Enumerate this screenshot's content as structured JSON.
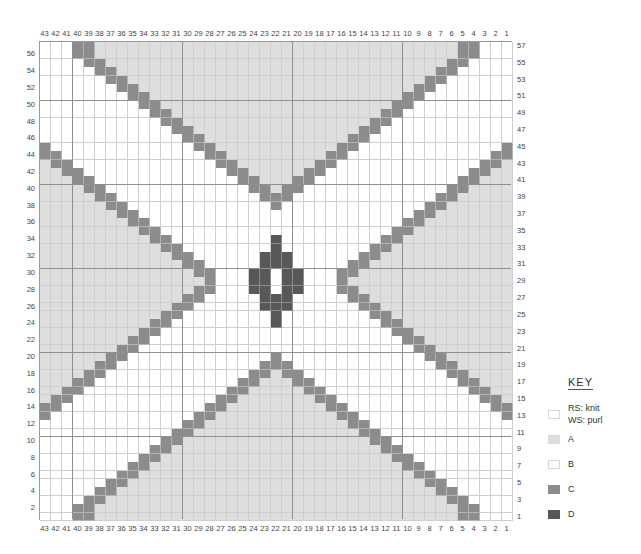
{
  "key": {
    "title": "KEY",
    "items": [
      {
        "id": "knit",
        "label_line1": "RS: knit",
        "label_line2": "WS: purl",
        "color": "#ffffff"
      },
      {
        "id": "A",
        "label": "A",
        "color": "#dedede"
      },
      {
        "id": "B",
        "label": "B",
        "color": "#ffffff"
      },
      {
        "id": "C",
        "label": "C",
        "color": "#8c8c8c"
      },
      {
        "id": "D",
        "label": "D",
        "color": "#585858"
      }
    ]
  },
  "chart_data": {
    "type": "heatmap",
    "columns": 43,
    "rows": 57,
    "column_labels": [
      43,
      42,
      41,
      40,
      39,
      38,
      37,
      36,
      35,
      34,
      33,
      32,
      31,
      30,
      29,
      28,
      27,
      26,
      25,
      24,
      23,
      22,
      21,
      20,
      19,
      18,
      17,
      16,
      15,
      14,
      13,
      12,
      11,
      10,
      9,
      8,
      7,
      6,
      5,
      4,
      3,
      2,
      1
    ],
    "row_labels_left": [
      56,
      54,
      52,
      50,
      48,
      46,
      44,
      42,
      40,
      38,
      36,
      34,
      32,
      30,
      28,
      26,
      24,
      22,
      20,
      18,
      16,
      14,
      12,
      10,
      8,
      6,
      4,
      2
    ],
    "row_labels_right": [
      57,
      55,
      53,
      51,
      49,
      47,
      45,
      43,
      41,
      39,
      37,
      35,
      33,
      31,
      29,
      27,
      25,
      23,
      21,
      19,
      17,
      15,
      13,
      11,
      9,
      7,
      5,
      3,
      1
    ],
    "major_gridlines": {
      "every": 10,
      "col_boundaries_after": [
        41,
        31,
        21,
        11
      ],
      "row_boundaries_above": [
        50,
        40,
        30,
        20,
        10
      ]
    },
    "colors": {
      "A": "#dedede",
      "B": "#ffffff",
      "C": "#8c8c8c",
      "D": "#585858"
    },
    "symmetry": "mirror about column 22 and row 29",
    "quadrant_rules": {
      "note": "R = row>=29 ? row : 58-row; Cm = col>=22 ? col : 44-col",
      "C_top_diagonal": "R in 38..57, Cm in {R-16, R-17} within 22..40; row 57 -> {40,39}",
      "C_side_diagonal": "R in 29..45, Cm in {R-1, R-2} within 22..43; row 29 -> {28}",
      "A_top_V_interior": "R >= 39 and Cm < R-17",
      "A_side_wedge": "R <= 44 and Cm >= R",
      "D_center": {
        "34": [
          22
        ],
        "33": [
          22
        ],
        "32": [
          22,
          23
        ],
        "31": [
          22,
          23
        ],
        "30": [
          23,
          24
        ],
        "29": [
          23,
          24
        ]
      }
    },
    "D_cells": [
      {
        "row": 34,
        "cols": [
          22
        ]
      },
      {
        "row": 33,
        "cols": [
          22
        ]
      },
      {
        "row": 32,
        "cols": [
          23,
          22,
          21
        ]
      },
      {
        "row": 31,
        "cols": [
          23,
          22,
          21
        ]
      },
      {
        "row": 30,
        "cols": [
          24,
          23,
          21,
          20
        ]
      },
      {
        "row": 29,
        "cols": [
          24,
          23,
          21,
          20
        ]
      },
      {
        "row": 28,
        "cols": [
          24,
          23,
          21,
          20
        ]
      },
      {
        "row": 27,
        "cols": [
          23,
          22,
          21
        ]
      },
      {
        "row": 26,
        "cols": [
          23,
          22,
          21
        ]
      },
      {
        "row": 25,
        "cols": [
          22
        ]
      },
      {
        "row": 24,
        "cols": [
          22
        ]
      }
    ],
    "legend_position": "right-bottom"
  }
}
